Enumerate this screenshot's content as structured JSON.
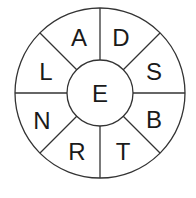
{
  "puzzle": {
    "type": "word-wheel",
    "center_letter": "E",
    "outer_letters": [
      "D",
      "S",
      "B",
      "T",
      "R",
      "N",
      "L",
      "A"
    ],
    "segments": [
      {
        "position": "top-right",
        "letter": "D"
      },
      {
        "position": "right-upper",
        "letter": "S"
      },
      {
        "position": "right-lower",
        "letter": "B"
      },
      {
        "position": "bottom-right",
        "letter": "T"
      },
      {
        "position": "bottom-left",
        "letter": "R"
      },
      {
        "position": "left-lower",
        "letter": "N"
      },
      {
        "position": "left-upper",
        "letter": "L"
      },
      {
        "position": "top-left",
        "letter": "A"
      }
    ],
    "line_color": "#333333"
  }
}
